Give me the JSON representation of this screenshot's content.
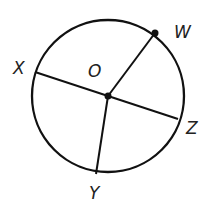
{
  "diagram": {
    "type": "circle-with-radii",
    "center": {
      "label": "O",
      "x": 108,
      "y": 96
    },
    "radius": 76,
    "points": [
      {
        "label": "W",
        "x": 155,
        "y": 33,
        "dot": true
      },
      {
        "label": "X",
        "x": 35,
        "y": 72,
        "dot": false
      },
      {
        "label": "Z",
        "x": 178,
        "y": 119,
        "dot": false
      },
      {
        "label": "Y",
        "x": 96,
        "y": 174,
        "dot": false
      }
    ],
    "segments": [
      "OW",
      "XZ",
      "OY"
    ],
    "labels": {
      "O": "O",
      "W": "W",
      "X": "X",
      "Z": "Z",
      "Y": "Y"
    }
  }
}
